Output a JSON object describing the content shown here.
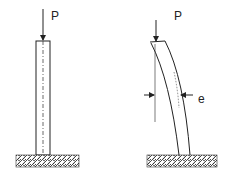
{
  "diagram": {
    "title": "",
    "figures": [
      {
        "id": "straight-column",
        "load_label": "P"
      },
      {
        "id": "deflected-column",
        "load_label": "P",
        "eccentricity_label": "e"
      }
    ],
    "colors": {
      "stroke": "#222222",
      "background": "#ffffff"
    }
  }
}
